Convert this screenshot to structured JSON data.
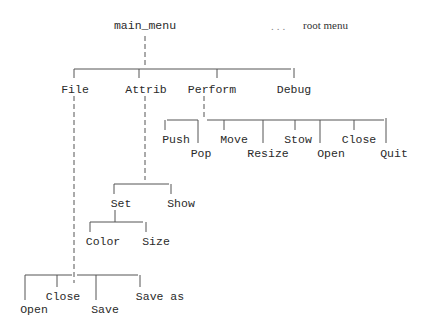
{
  "diagram": {
    "title": "main_menu",
    "legend": {
      "dots": "...",
      "text": "root menu"
    },
    "nodes": {
      "root": "main_menu",
      "file": "File",
      "attrib": "Attrib",
      "perform": "Perform",
      "debug": "Debug",
      "push": "Push",
      "pop": "Pop",
      "move": "Move",
      "resize": "Resize",
      "stow": "Stow",
      "open_p": "Open",
      "close_p": "Close",
      "quit": "Quit",
      "set": "Set",
      "show": "Show",
      "color": "Color",
      "size": "Size",
      "open_f": "Open",
      "close_f": "Close",
      "save": "Save",
      "save_as": "Save as"
    },
    "edges": [
      [
        "main_menu",
        "File"
      ],
      [
        "main_menu",
        "Attrib"
      ],
      [
        "main_menu",
        "Perform"
      ],
      [
        "main_menu",
        "Debug"
      ],
      [
        "Perform",
        "Push"
      ],
      [
        "Perform",
        "Pop"
      ],
      [
        "Perform",
        "Move"
      ],
      [
        "Perform",
        "Resize"
      ],
      [
        "Perform",
        "Stow"
      ],
      [
        "Perform",
        "Open"
      ],
      [
        "Perform",
        "Close"
      ],
      [
        "Perform",
        "Quit"
      ],
      [
        "Attrib",
        "Set"
      ],
      [
        "Attrib",
        "Show"
      ],
      [
        "Set",
        "Color"
      ],
      [
        "Set",
        "Size"
      ],
      [
        "File",
        "Open"
      ],
      [
        "File",
        "Close"
      ],
      [
        "File",
        "Save"
      ],
      [
        "File",
        "Save as"
      ]
    ]
  }
}
